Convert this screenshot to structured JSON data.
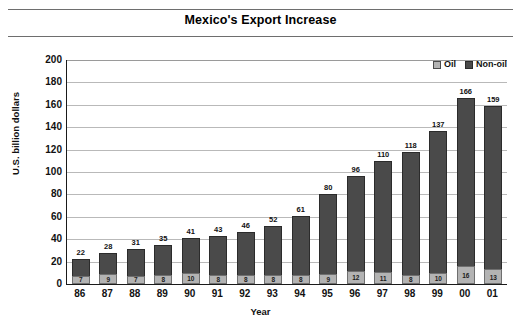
{
  "title": "Mexico's Export Increase",
  "legend": {
    "position": "top-right",
    "items": [
      {
        "label": "Oil",
        "color": "#b3b3b3",
        "key": "oil"
      },
      {
        "label": "Non-oil",
        "color": "#4a4a4a",
        "key": "nonoil"
      }
    ]
  },
  "chart_data": {
    "type": "bar",
    "subtype": "stacked",
    "title": "Mexico's Export Increase",
    "xlabel": "Year",
    "ylabel": "U.S. billion dollars",
    "ylim": [
      0,
      200
    ],
    "ytick_step": 20,
    "yticks": [
      200,
      180,
      160,
      140,
      120,
      100,
      80,
      60,
      40,
      20,
      0
    ],
    "grid": true,
    "legend": [
      "Oil",
      "Non-oil"
    ],
    "categories": [
      "86",
      "87",
      "88",
      "89",
      "90",
      "91",
      "92",
      "93",
      "94",
      "95",
      "96",
      "97",
      "98",
      "99",
      "00",
      "01"
    ],
    "series": [
      {
        "name": "Oil",
        "color": "#b3b3b3",
        "values": [
          7,
          9,
          7,
          8,
          10,
          8,
          8,
          8,
          8,
          9,
          12,
          11,
          8,
          10,
          16,
          13
        ]
      },
      {
        "name": "Non-oil",
        "color": "#4a4a4a",
        "values": [
          15,
          19,
          24,
          27,
          31,
          35,
          38,
          44,
          53,
          71,
          84,
          99,
          110,
          127,
          150,
          146
        ]
      }
    ],
    "totals": [
      22,
      28,
      31,
      35,
      41,
      43,
      46,
      52,
      61,
      80,
      96,
      110,
      118,
      137,
      166,
      159
    ],
    "total_labels": [
      "22",
      "28",
      "31",
      "35",
      "41",
      "43",
      "46",
      "52",
      "61",
      "80",
      "96",
      "110",
      "118",
      "137",
      "166",
      "159"
    ],
    "oil_labels": [
      "7",
      "9",
      "7",
      "8",
      "10",
      "8",
      "8",
      "8",
      "8",
      "9",
      "12",
      "11",
      "8",
      "10",
      "16",
      "13"
    ]
  }
}
